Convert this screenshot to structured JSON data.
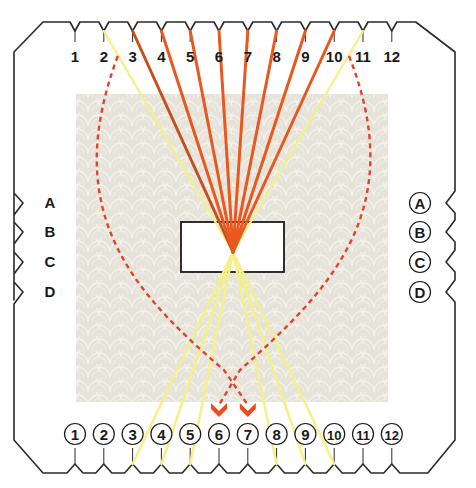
{
  "diagram": {
    "top_slots": [
      "1",
      "2",
      "3",
      "4",
      "5",
      "6",
      "7",
      "8",
      "9",
      "10",
      "11",
      "12"
    ],
    "bottom_slots": [
      "1",
      "2",
      "3",
      "4",
      "5",
      "6",
      "7",
      "8",
      "9",
      "10",
      "11",
      "12"
    ],
    "left_slots": [
      "A",
      "B",
      "C",
      "D"
    ],
    "right_slots": [
      "A",
      "B",
      "C",
      "D"
    ],
    "bottom_slot_style": "circled",
    "right_slot_style": "circled",
    "colors": {
      "card_outline": "#2a2a2a",
      "texture_bg": "#e6e3da",
      "texture_line": "#f3f1ea",
      "strand_dark_orange": "#c4501e",
      "strand_orange": "#e8581f",
      "strand_yellow": "#f4f08a",
      "dashed_path": "#e0442a",
      "arrow": "#f04a1c"
    },
    "strands": [
      {
        "from_top": "3",
        "to": "center",
        "color": "strand_dark_orange"
      },
      {
        "from_top": "4",
        "to": "center",
        "color": "strand_orange"
      },
      {
        "from_top": "5",
        "to": "center",
        "color": "strand_orange"
      },
      {
        "from_top": "6",
        "to": "center",
        "color": "strand_orange"
      },
      {
        "from_top": "7",
        "to": "center",
        "color": "strand_orange"
      },
      {
        "from_top": "8",
        "to": "center",
        "color": "strand_orange"
      },
      {
        "from_top": "9",
        "to": "center",
        "color": "strand_orange"
      },
      {
        "from_top": "10",
        "to": "center",
        "color": "strand_orange"
      },
      {
        "from_top": "2",
        "to": "center",
        "color": "strand_yellow"
      },
      {
        "from_top": "11",
        "to": "center",
        "color": "strand_yellow"
      },
      {
        "from": "center",
        "to_bottom": "3",
        "color": "strand_yellow"
      },
      {
        "from": "center",
        "to_bottom": "4",
        "color": "strand_yellow"
      },
      {
        "from": "center",
        "to_bottom": "5",
        "color": "strand_yellow"
      },
      {
        "from": "center",
        "to_bottom": "8",
        "color": "strand_yellow"
      },
      {
        "from": "center",
        "to_bottom": "9",
        "color": "strand_yellow"
      },
      {
        "from": "center",
        "to_bottom": "10",
        "color": "strand_yellow"
      }
    ],
    "moves": [
      {
        "from_top": "2",
        "to_bottom": "7",
        "style": "dashed"
      },
      {
        "from_top": "11",
        "to_bottom": "6",
        "style": "dashed"
      }
    ]
  }
}
